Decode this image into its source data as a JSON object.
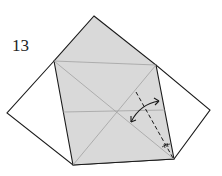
{
  "step": {
    "number": "13"
  },
  "colors": {
    "paper_fill": "#d9d9d9",
    "outline": "#1a1a1a",
    "crease": "#9a9a9a",
    "background": "#ffffff"
  },
  "shapes": {
    "back_layer": "outline of the white square seen behind (left and right wing points)",
    "front_layer": "shaded kite/square flap with diagonal creases",
    "fold_line": "dashed valley fold from bottom-right corner",
    "arrow": "double-headed curved arrow indicating fold and unfold",
    "angle_marks": "equal-angle bisector marks at bottom-right corner"
  }
}
